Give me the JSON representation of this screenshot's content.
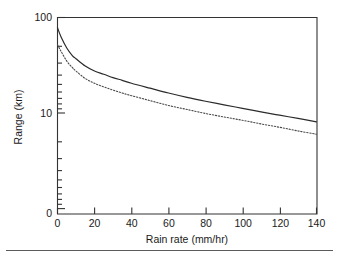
{
  "figure": {
    "background": "#ffffff",
    "frame_color": "#333333",
    "has_bottom_rule": true
  },
  "axes": {
    "x": {
      "title": "Rain rate (mm/hr)",
      "ticks": [
        "0",
        "20",
        "40",
        "60",
        "80",
        "100",
        "120",
        "140"
      ],
      "min": 0,
      "max": 140,
      "scale": "linear"
    },
    "y": {
      "title": "Range (km)",
      "ticks": [
        "100",
        "10",
        "0"
      ],
      "scale": "log",
      "min_decade": 1,
      "max_decade": 100
    }
  },
  "chart_data": {
    "type": "line",
    "title": "",
    "xlabel": "Rain rate (mm/hr)",
    "ylabel": "Range (km)",
    "xlim": [
      0,
      140
    ],
    "ylim": [
      1,
      100
    ],
    "yscale": "log",
    "xscale": "linear",
    "grid": false,
    "legend": "none",
    "x": [
      0,
      2,
      5,
      8,
      10,
      15,
      20,
      25,
      30,
      35,
      40,
      50,
      60,
      70,
      80,
      90,
      100,
      110,
      120,
      130,
      140
    ],
    "series": [
      {
        "name": "Solid curve",
        "style": "solid",
        "color": "#2b2b2b",
        "values": [
          78,
          62,
          48,
          40,
          37,
          31,
          27.5,
          25.5,
          23.5,
          22,
          20.5,
          18.2,
          16.2,
          14.6,
          13.3,
          12.2,
          11.2,
          10.3,
          9.5,
          8.8,
          8.1
        ]
      },
      {
        "name": "Dotted curve",
        "style": "dotted",
        "color": "#4a4a4a",
        "values": [
          52,
          44,
          35,
          30,
          27.5,
          23,
          20.5,
          18.8,
          17.4,
          16.2,
          15.2,
          13.5,
          12.0,
          10.9,
          9.9,
          9.1,
          8.4,
          7.7,
          7.1,
          6.5,
          6.0
        ]
      }
    ]
  }
}
